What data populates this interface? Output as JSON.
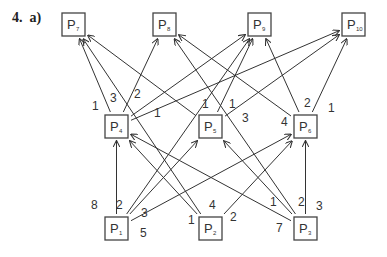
{
  "question": {
    "number": "4.",
    "part": "a)"
  },
  "nodes": [
    {
      "id": "P7",
      "label": "P",
      "sub": "7",
      "x": 62,
      "y": 13
    },
    {
      "id": "P8",
      "label": "P",
      "sub": "8",
      "x": 153,
      "y": 13
    },
    {
      "id": "P9",
      "label": "P",
      "sub": "9",
      "x": 248,
      "y": 13
    },
    {
      "id": "P10",
      "label": "P",
      "sub": "10",
      "x": 342,
      "y": 13
    },
    {
      "id": "P4",
      "label": "P",
      "sub": "4",
      "x": 105,
      "y": 115
    },
    {
      "id": "P5",
      "label": "P",
      "sub": "5",
      "x": 199,
      "y": 115
    },
    {
      "id": "P6",
      "label": "P",
      "sub": "6",
      "x": 294,
      "y": 115
    },
    {
      "id": "P1",
      "label": "P",
      "sub": "1",
      "x": 105,
      "y": 217
    },
    {
      "id": "P2",
      "label": "P",
      "sub": "2",
      "x": 199,
      "y": 217
    },
    {
      "id": "P3",
      "label": "P",
      "sub": "3",
      "x": 294,
      "y": 217
    }
  ],
  "edges": [
    {
      "from": "P1",
      "to": "P4",
      "weight": "8"
    },
    {
      "from": "P1",
      "to": "P9",
      "weight": "2"
    },
    {
      "from": "P1",
      "to": "P5",
      "weight": "3"
    },
    {
      "from": "P1",
      "to": "P6",
      "weight": "5"
    },
    {
      "from": "P2",
      "to": "P4",
      "weight": "1"
    },
    {
      "from": "P2",
      "to": "P7",
      "weight": "4"
    },
    {
      "from": "P2",
      "to": "P6",
      "weight": "2"
    },
    {
      "from": "P3",
      "to": "P4",
      "weight": "7"
    },
    {
      "from": "P3",
      "to": "P8",
      "weight": "1"
    },
    {
      "from": "P3",
      "to": "P5",
      "weight": "2"
    },
    {
      "from": "P3",
      "to": "P6",
      "weight": "3"
    },
    {
      "from": "P4",
      "to": "P7",
      "weight": "1"
    },
    {
      "from": "P4",
      "to": "P8",
      "weight": "3"
    },
    {
      "from": "P4",
      "to": "P9",
      "weight": "2"
    },
    {
      "from": "P4",
      "to": "P10",
      "weight": "1"
    },
    {
      "from": "P5",
      "to": "P9",
      "weight": "1"
    },
    {
      "from": "P5",
      "to": "P7",
      "weight": "1"
    },
    {
      "from": "P5",
      "to": "P10",
      "weight": "3"
    },
    {
      "from": "P6",
      "to": "P8",
      "weight": "4"
    },
    {
      "from": "P6",
      "to": "P9",
      "weight": "2"
    },
    {
      "from": "P6",
      "to": "P10",
      "weight": "1"
    }
  ],
  "labels": [
    {
      "text": "8",
      "x": 91,
      "y": 209
    },
    {
      "text": "2",
      "x": 116,
      "y": 209
    },
    {
      "text": "3",
      "x": 141,
      "y": 217
    },
    {
      "text": "5",
      "x": 140,
      "y": 237
    },
    {
      "text": "1",
      "x": 188,
      "y": 224
    },
    {
      "text": "4",
      "x": 209,
      "y": 209
    },
    {
      "text": "2",
      "x": 230,
      "y": 221
    },
    {
      "text": "1",
      "x": 270,
      "y": 206
    },
    {
      "text": "2",
      "x": 298,
      "y": 206
    },
    {
      "text": "3",
      "x": 316,
      "y": 210
    },
    {
      "text": "7",
      "x": 276,
      "y": 232
    },
    {
      "text": "1",
      "x": 92,
      "y": 110
    },
    {
      "text": "3",
      "x": 110,
      "y": 102
    },
    {
      "text": "2",
      "x": 134,
      "y": 98
    },
    {
      "text": "1",
      "x": 154,
      "y": 117
    },
    {
      "text": "1",
      "x": 202,
      "y": 108
    },
    {
      "text": "1",
      "x": 229,
      "y": 108
    },
    {
      "text": "3",
      "x": 242,
      "y": 122
    },
    {
      "text": "4",
      "x": 281,
      "y": 126
    },
    {
      "text": "2",
      "x": 304,
      "y": 107
    },
    {
      "text": "1",
      "x": 328,
      "y": 112
    }
  ]
}
